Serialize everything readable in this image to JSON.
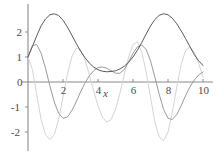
{
  "figure": {
    "background": "#ffffff",
    "axis_color": "#7a7a7a",
    "tick_label_color": "#4a4a4a"
  },
  "axes": {
    "xlabel": "x",
    "ylabel": "",
    "x_ticks": [
      "0",
      "2",
      "4",
      "6",
      "8",
      "10"
    ],
    "x_tick_values": [
      0,
      2,
      4,
      6,
      8,
      10
    ],
    "y_ticks": [
      "2",
      "1",
      "0",
      "-1",
      "-2"
    ],
    "y_tick_values": [
      2,
      1,
      0,
      -1,
      -2
    ],
    "xlim": [
      -0.1,
      10
    ],
    "ylim": [
      -2.55,
      2.95
    ],
    "grid": false,
    "legend": "none",
    "spine_style": "crossed-axes-at-origin"
  },
  "chart_data": {
    "type": "line",
    "title": "",
    "xlabel": "x",
    "ylabel": "",
    "xlim": [
      -0.1,
      10
    ],
    "ylim": [
      -2.55,
      2.95
    ],
    "grid": false,
    "legend_position": "none",
    "x": [
      0,
      0.25,
      0.5,
      0.75,
      1,
      1.25,
      1.5,
      1.75,
      2,
      2.25,
      2.5,
      2.75,
      3,
      3.25,
      3.5,
      3.75,
      4,
      4.25,
      4.5,
      4.75,
      5,
      5.25,
      5.5,
      5.75,
      6,
      6.25,
      6.5,
      6.75,
      7,
      7.25,
      7.5,
      7.75,
      8,
      8.25,
      8.5,
      8.75,
      9,
      9.25,
      9.5,
      9.75,
      10
    ],
    "series": [
      {
        "name": "f",
        "color": "#5a5a5a",
        "linewidth": 1.0,
        "values": [
          1.0,
          1.42,
          1.85,
          2.25,
          2.52,
          2.69,
          2.73,
          2.66,
          2.47,
          2.2,
          1.88,
          1.55,
          1.24,
          0.98,
          0.76,
          0.6,
          0.49,
          0.43,
          0.41,
          0.42,
          0.45,
          0.52,
          0.63,
          0.79,
          1.0,
          1.27,
          1.58,
          1.92,
          2.24,
          2.5,
          2.67,
          2.73,
          2.69,
          2.55,
          2.33,
          2.05,
          1.74,
          1.42,
          1.1,
          0.85,
          0.66
        ]
      },
      {
        "name": "f-prime",
        "color": "#9a9a9a",
        "linewidth": 1.0,
        "values": [
          1.0,
          1.45,
          1.5,
          1.15,
          0.55,
          -0.15,
          -0.8,
          -1.25,
          -1.45,
          -1.4,
          -1.15,
          -0.8,
          -0.4,
          -0.05,
          0.25,
          0.45,
          0.58,
          0.6,
          0.55,
          0.45,
          0.35,
          0.35,
          0.5,
          0.8,
          1.15,
          1.4,
          1.48,
          1.3,
          0.85,
          0.2,
          -0.5,
          -1.1,
          -1.45,
          -1.5,
          -1.3,
          -0.95,
          -0.55,
          -0.2,
          0.08,
          0.28,
          0.4
        ]
      },
      {
        "name": "f-double-prime",
        "color": "#d4d4d4",
        "linewidth": 1.0,
        "values": [
          1.0,
          0.5,
          -0.5,
          -1.5,
          -2.1,
          -2.3,
          -2.1,
          -1.5,
          -0.6,
          0.3,
          1.0,
          1.35,
          1.3,
          0.9,
          0.3,
          -0.35,
          -0.95,
          -1.4,
          -1.6,
          -1.5,
          -1.1,
          -0.45,
          0.3,
          1.0,
          1.5,
          1.6,
          1.2,
          0.4,
          -0.6,
          -1.6,
          -2.2,
          -2.35,
          -2.0,
          -1.2,
          -0.2,
          0.7,
          1.25,
          1.4,
          1.2,
          0.75,
          0.2
        ]
      }
    ]
  }
}
